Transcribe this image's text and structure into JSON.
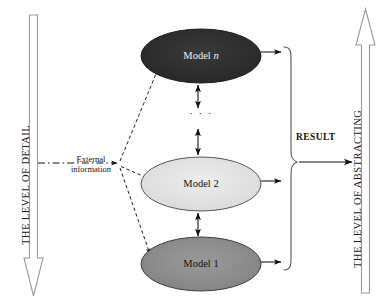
{
  "diagram": {
    "background_color": "#ffffff",
    "axes": {
      "left": {
        "label": "THE LEVEL OF DETAIL",
        "direction": "down",
        "style": "hollow-outlined-arrow",
        "stroke_color": "#9a9a9a"
      },
      "right": {
        "label": "THE LEVEL OF ABSTRACTING",
        "direction": "up",
        "style": "hollow-outlined-arrow",
        "stroke_color": "#9a9a9a"
      }
    },
    "nodes": [
      {
        "id": "model-n",
        "label": "Model",
        "label_italic_suffix": "n",
        "fill_color": "#2f2f2f",
        "text_color": "#f2f2f2",
        "stroke_color": "#1a1a1a"
      },
      {
        "id": "model-2",
        "label": "Model 2",
        "fill_color": "#e3e3e3",
        "text_color": "#111111",
        "stroke_color": "#4a4a4a"
      },
      {
        "id": "model-1",
        "label": "Model 1",
        "fill_color": "#8c8c8c",
        "text_color": "#111111",
        "stroke_color": "#3a3a3a"
      }
    ],
    "vertical_continuation": "· · ·",
    "external_input": {
      "line1": "External",
      "line2": "information",
      "line_style": "dash-dot",
      "fan_out_style": "dashed",
      "targets": [
        "model-n",
        "model-2",
        "model-1"
      ]
    },
    "output": {
      "label": "RESULT",
      "collector": "right-curly-brace",
      "source_nodes": [
        "model-n",
        "model-2",
        "model-1"
      ],
      "arrow_color": "#111111"
    }
  }
}
